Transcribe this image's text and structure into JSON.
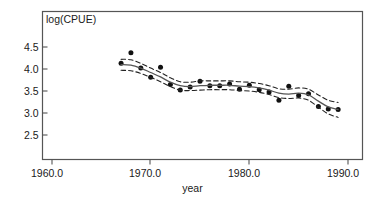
{
  "chart_data": {
    "type": "scatter",
    "title": "",
    "subtitle": "",
    "xlabel": "year",
    "ylabel": "log(CPUE)",
    "ylabel_position": "inside-top-left",
    "grid": false,
    "legend": null,
    "xlim": [
      1957.0,
      1991.8
    ],
    "ylim": [
      2.28,
      4.72
    ],
    "xticks": [
      1960.0,
      1970.0,
      1980.0,
      1990.0
    ],
    "xticklabels": [
      "1960.0",
      "1970.0",
      "1980.0",
      "1990.0"
    ],
    "yticks": [
      2.5,
      3.0,
      3.5,
      4.0,
      4.5
    ],
    "yticklabels": [
      "2.5",
      "3.0",
      "3.5",
      "4.0",
      "4.5"
    ],
    "x": [
      1967,
      1968,
      1969,
      1970,
      1971,
      1972,
      1973,
      1974,
      1975,
      1976,
      1977,
      1978,
      1979,
      1980,
      1981,
      1982,
      1983,
      1984,
      1985,
      1986,
      1987,
      1988,
      1989
    ],
    "values": [
      4.13,
      4.37,
      4.02,
      3.81,
      4.04,
      3.65,
      3.52,
      3.59,
      3.72,
      3.62,
      3.62,
      3.66,
      3.54,
      3.63,
      3.53,
      3.48,
      3.29,
      3.61,
      3.4,
      3.44,
      3.15,
      3.09,
      3.08
    ],
    "series": [
      {
        "name": "observed log(CPUE)",
        "style": "points",
        "marker": "filled-circle",
        "color": "#111111",
        "x": [
          1967,
          1968,
          1969,
          1970,
          1971,
          1972,
          1973,
          1974,
          1975,
          1976,
          1977,
          1978,
          1979,
          1980,
          1981,
          1982,
          1983,
          1984,
          1985,
          1986,
          1987,
          1988,
          1989
        ],
        "values": [
          4.13,
          4.37,
          4.02,
          3.81,
          4.04,
          3.65,
          3.52,
          3.59,
          3.72,
          3.62,
          3.62,
          3.66,
          3.54,
          3.63,
          3.53,
          3.48,
          3.29,
          3.61,
          3.4,
          3.44,
          3.15,
          3.09,
          3.08
        ]
      },
      {
        "name": "fitted smooth trend",
        "style": "solid-line",
        "color": "#555555",
        "x": [
          1967,
          1968,
          1969,
          1970,
          1971,
          1972,
          1973,
          1974,
          1975,
          1976,
          1977,
          1978,
          1979,
          1980,
          1981,
          1982,
          1983,
          1984,
          1985,
          1986,
          1987,
          1988,
          1989
        ],
        "values": [
          4.1,
          4.09,
          4.02,
          3.92,
          3.82,
          3.7,
          3.62,
          3.6,
          3.62,
          3.63,
          3.63,
          3.63,
          3.61,
          3.6,
          3.57,
          3.52,
          3.45,
          3.43,
          3.45,
          3.41,
          3.27,
          3.14,
          3.08
        ]
      },
      {
        "name": "upper confidence band",
        "style": "dashed-line",
        "color": "#222222",
        "x": [
          1967,
          1968,
          1969,
          1970,
          1971,
          1972,
          1973,
          1974,
          1975,
          1976,
          1977,
          1978,
          1979,
          1980,
          1981,
          1982,
          1983,
          1984,
          1985,
          1986,
          1987,
          1988,
          1989
        ],
        "values": [
          4.22,
          4.21,
          4.13,
          4.02,
          3.92,
          3.8,
          3.71,
          3.7,
          3.73,
          3.73,
          3.73,
          3.73,
          3.71,
          3.7,
          3.67,
          3.62,
          3.55,
          3.54,
          3.57,
          3.54,
          3.41,
          3.29,
          3.24
        ]
      },
      {
        "name": "lower confidence band",
        "style": "dashed-line",
        "color": "#222222",
        "x": [
          1967,
          1968,
          1969,
          1970,
          1971,
          1972,
          1973,
          1974,
          1975,
          1976,
          1977,
          1978,
          1979,
          1980,
          1981,
          1982,
          1983,
          1984,
          1985,
          1986,
          1987,
          1988,
          1989
        ],
        "values": [
          3.97,
          3.96,
          3.9,
          3.81,
          3.71,
          3.6,
          3.52,
          3.51,
          3.52,
          3.53,
          3.53,
          3.53,
          3.51,
          3.5,
          3.47,
          3.42,
          3.35,
          3.33,
          3.34,
          3.29,
          3.13,
          2.98,
          2.9
        ]
      }
    ]
  },
  "axes": {
    "x_title": "year",
    "y_title": "log(CPUE)",
    "x_tick_labels": [
      "1960.0",
      "1970.0",
      "1980.0",
      "1990.0"
    ],
    "y_tick_labels": [
      "4.5",
      "4.0",
      "3.5",
      "3.0",
      "2.5"
    ]
  },
  "colors": {
    "frame": "#555555",
    "point": "#111111",
    "fit_line": "#555555",
    "band_line": "#222222",
    "text": "#1a1a1a",
    "background": "#ffffff"
  }
}
